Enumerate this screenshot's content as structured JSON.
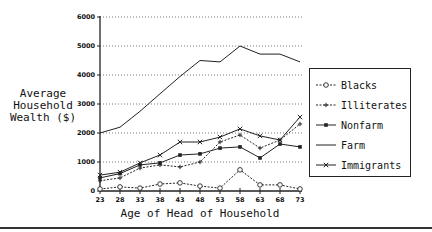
{
  "chart_data": {
    "type": "line",
    "title": "",
    "xlabel": "Age of Head of Household",
    "ylabel": "Average Household Wealth ($)",
    "ylabel_lines": [
      "Average",
      "Household",
      "Wealth ($)"
    ],
    "x": [
      23,
      28,
      33,
      38,
      43,
      48,
      53,
      58,
      63,
      68,
      73
    ],
    "x_tick_labels": [
      "23",
      "28",
      "33",
      "38",
      "43",
      "48",
      "53",
      "58",
      "63",
      "68",
      "73"
    ],
    "ylim": [
      0,
      6000
    ],
    "y_ticks": [
      0,
      1000,
      2000,
      3000,
      4000,
      5000,
      6000
    ],
    "y_tick_labels": [
      "0",
      "1000",
      "2000",
      "3000",
      "4000",
      "5000",
      "6000"
    ],
    "grid": "horizontal-dotted",
    "legend_position": "right",
    "series": [
      {
        "name": "Blacks",
        "marker": "circle",
        "line": "dashed",
        "values": [
          70,
          140,
          100,
          240,
          280,
          170,
          100,
          730,
          210,
          210,
          70
        ]
      },
      {
        "name": "Illiterates",
        "marker": "plus",
        "line": "dashed",
        "values": [
          350,
          450,
          790,
          900,
          830,
          1000,
          1690,
          1930,
          1480,
          1760,
          2310
        ]
      },
      {
        "name": "Nonfarm",
        "marker": "square",
        "line": "solid",
        "values": [
          450,
          600,
          900,
          970,
          1240,
          1280,
          1480,
          1520,
          1140,
          1620,
          1520
        ]
      },
      {
        "name": "Farm",
        "marker": "none",
        "line": "solid",
        "values": [
          2000,
          2200,
          2750,
          3350,
          3950,
          4500,
          4450,
          5000,
          4720,
          4720,
          4450
        ]
      },
      {
        "name": "Immigrants",
        "marker": "x",
        "line": "solid",
        "values": [
          550,
          650,
          970,
          1240,
          1690,
          1690,
          1860,
          2140,
          1900,
          1760,
          2550
        ]
      }
    ]
  }
}
